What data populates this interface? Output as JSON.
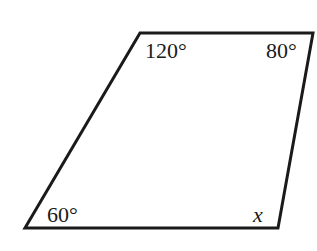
{
  "diagram": {
    "shape": "quadrilateral",
    "stroke_color": "#1a1a1a",
    "fill_color": "#ffffff",
    "vertices": [
      {
        "name": "top-left",
        "x": 140,
        "y": 33
      },
      {
        "name": "top-right",
        "x": 313,
        "y": 33
      },
      {
        "name": "bottom-right",
        "x": 278,
        "y": 228
      },
      {
        "name": "bottom-left",
        "x": 25,
        "y": 228
      }
    ],
    "angles": {
      "top_left": "120°",
      "top_right": "80°",
      "bottom_left": "60°",
      "bottom_right": "x"
    }
  }
}
